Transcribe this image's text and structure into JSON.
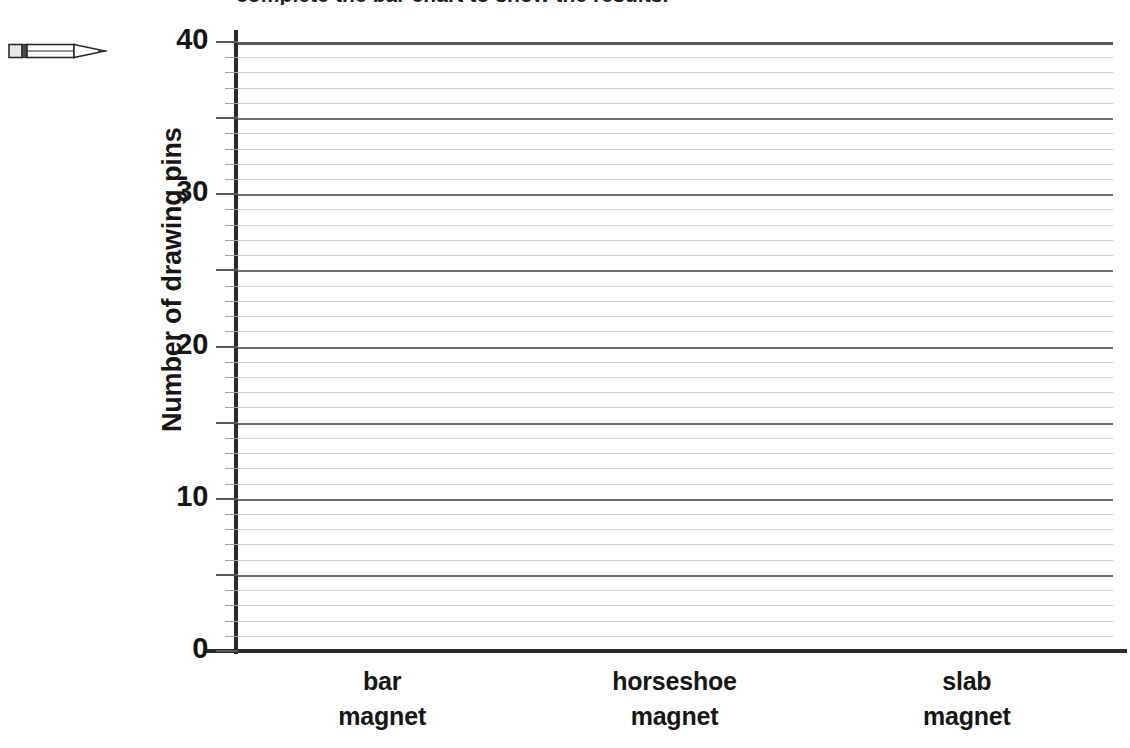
{
  "worksheet": {
    "clipped_heading": "complete the bar chart to show the results.",
    "pencil_icon": "pencil-icon"
  },
  "chart_data": {
    "type": "bar",
    "title": "",
    "xlabel": "",
    "ylabel": "Number of drawing pins",
    "categories": [
      "bar magnet",
      "horseshoe magnet",
      "slab magnet"
    ],
    "category_lines": [
      [
        "bar",
        "magnet"
      ],
      [
        "horseshoe",
        "magnet"
      ],
      [
        "slab",
        "magnet"
      ]
    ],
    "values": [
      null,
      null,
      null
    ],
    "ylim": [
      0,
      40
    ],
    "ytick_labels": [
      "0",
      "10",
      "20",
      "30",
      "40"
    ],
    "ytick_values": [
      0,
      10,
      20,
      30,
      40
    ],
    "major_gridline_interval": 5,
    "minor_gridline_interval": 1,
    "grid": true,
    "legend": "none",
    "note": "Empty grid: no bars drawn; axes blank for student to complete.",
    "colors": {
      "axis": "#2b2b2b",
      "major_gridline": "#6c6f73",
      "minor_gridline": "#c9cbcd",
      "text": "#161616"
    }
  }
}
